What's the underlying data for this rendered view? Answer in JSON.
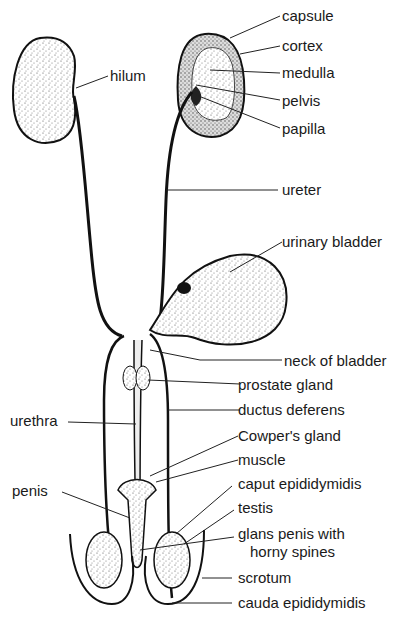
{
  "figure": {
    "ink_color": "#111111",
    "stipple_color": "#555555",
    "labels": {
      "capsule": "capsule",
      "cortex": "cortex",
      "medulla": "medulla",
      "pelvis": "pelvis",
      "papilla": "papilla",
      "hilum": "hilum",
      "ureter": "ureter",
      "urinary_bladder": "urinary bladder",
      "neck_of_bladder": "neck of bladder",
      "prostate_gland": "prostate gland",
      "urethra": "urethra",
      "ductus_deferens": "ductus deferens",
      "cowpers_gland": "Cowper's gland",
      "muscle": "muscle",
      "penis": "penis",
      "caput_epididymidis": "caput epididymidis",
      "testis": "testis",
      "glans_penis_line1": "glans penis with",
      "glans_penis_line2": "horny spines",
      "scrotum": "scrotum",
      "cauda_epididymidis": "cauda epididymidis"
    }
  }
}
